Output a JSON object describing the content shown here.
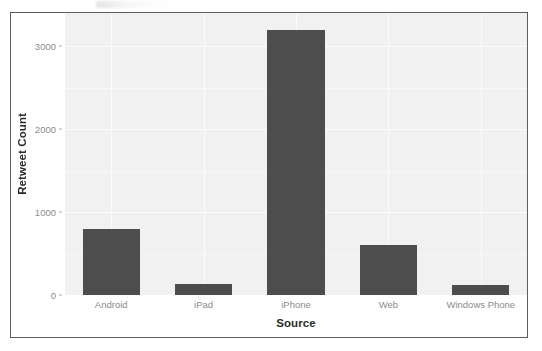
{
  "chart_data": {
    "type": "bar",
    "title": "",
    "xlabel": "Source",
    "ylabel": "Retweet Count",
    "categories": [
      "Android",
      "iPad",
      "iPhone",
      "Web",
      "Windows Phone"
    ],
    "values": [
      800,
      130,
      3200,
      600,
      120
    ],
    "ytick_labels": [
      "0",
      "1000",
      "2000",
      "3000"
    ],
    "ytick_values": [
      0,
      1000,
      2000,
      3000
    ],
    "ylim": [
      0,
      3400
    ],
    "grid": true,
    "legend": "none",
    "bar_color": "#4d4d4d",
    "panel_background": "#f1f1f1",
    "gridline_color": "#fcfcfc",
    "tick_label_color": "#8b8b8b",
    "axis_title_color": "#2b2b2b",
    "frame_border_color": "#5d5d5d"
  }
}
